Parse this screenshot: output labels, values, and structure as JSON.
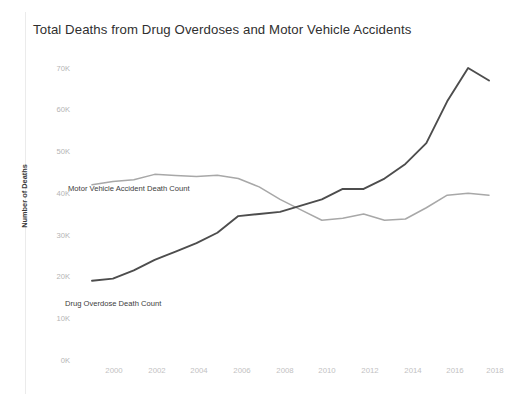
{
  "title": "Total Deaths from Drug Overdoses and Motor Vehicle Accidents",
  "axis": {
    "y_title": "Number of Deaths",
    "y_ticks": [
      "70K",
      "60K",
      "50K",
      "40K",
      "30K",
      "20K",
      "10K",
      "0K"
    ],
    "x_ticks": [
      "2000",
      "2002",
      "2004",
      "2006",
      "2008",
      "2010",
      "2012",
      "2014",
      "2016",
      "2018"
    ]
  },
  "labels": {
    "motor_vehicle": "Motor Vehicle Accident Death Count",
    "drug_overdose": "Drug Overdose Death Count"
  },
  "colors": {
    "drug_overdose": "#4d4d4d",
    "motor_vehicle": "#a8a8a8",
    "title": "#2f2f2f",
    "tick": "#bdbdbd",
    "background": "#ffffff"
  },
  "chart_data": {
    "type": "line",
    "title": "Total Deaths from Drug Overdoses and Motor Vehicle Accidents",
    "xlabel": "",
    "ylabel": "Number of Deaths",
    "xlim": [
      1999,
      2018
    ],
    "ylim": [
      0,
      70000
    ],
    "grid": false,
    "legend": "inline-labels",
    "x": [
      1999,
      2000,
      2001,
      2002,
      2003,
      2004,
      2005,
      2006,
      2007,
      2008,
      2009,
      2010,
      2011,
      2012,
      2013,
      2014,
      2015,
      2016,
      2017,
      2018
    ],
    "series": [
      {
        "name": "Drug Overdose Death Count",
        "color": "#4d4d4d",
        "values": [
          19000,
          19500,
          21500,
          24000,
          26000,
          28000,
          30500,
          34500,
          35000,
          35500,
          37000,
          38500,
          41000,
          41000,
          43500,
          47000,
          52000,
          62000,
          70000,
          67000
        ]
      },
      {
        "name": "Motor Vehicle Accident Death Count",
        "color": "#a8a8a8",
        "values": [
          42000,
          42800,
          43200,
          44500,
          44200,
          44000,
          44300,
          43500,
          41500,
          38500,
          36000,
          33500,
          34000,
          35000,
          33500,
          33800,
          36500,
          39500,
          40000,
          39500
        ]
      }
    ]
  }
}
